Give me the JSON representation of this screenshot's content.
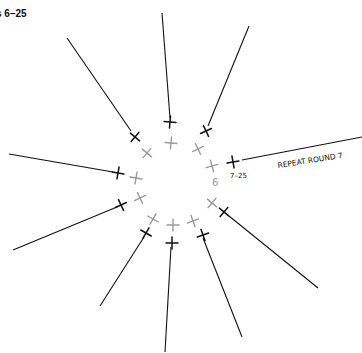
{
  "title": "s 6–25",
  "colors": {
    "ink": "#111111",
    "gray": "#9a9a9a",
    "bg": "#ffffff"
  },
  "annotations": {
    "repeat": "REPEAT ROUND 7",
    "round_label": "7–25",
    "round_number": "6"
  },
  "diagram": {
    "type": "crochet-round-chart",
    "spokes": [
      {
        "from": [
          67,
          38
        ],
        "to": [
          131,
          131
        ]
      },
      {
        "from": [
          162,
          13
        ],
        "to": [
          170,
          118
        ]
      },
      {
        "from": [
          249,
          26
        ],
        "to": [
          208,
          126
        ]
      },
      {
        "from": [
          242,
          160
        ],
        "to": [
          362,
          137
        ]
      },
      {
        "from": [
          229,
          216
        ],
        "to": [
          318,
          288
        ]
      },
      {
        "from": [
          203,
          238
        ],
        "to": [
          242,
          337
        ]
      },
      {
        "from": [
          171,
          247
        ],
        "to": [
          165,
          352
        ]
      },
      {
        "from": [
          144,
          237
        ],
        "to": [
          100,
          306
        ]
      },
      {
        "from": [
          117,
          207
        ],
        "to": [
          13,
          250
        ]
      },
      {
        "from": [
          113,
          172
        ],
        "to": [
          9,
          154
        ]
      }
    ],
    "black_stitches": [
      {
        "x": 135,
        "y": 137,
        "rot": 40
      },
      {
        "x": 170,
        "y": 122,
        "rot": 5
      },
      {
        "x": 206,
        "y": 131,
        "rot": -25
      },
      {
        "x": 233,
        "y": 162,
        "rot": -10
      },
      {
        "x": 224,
        "y": 212,
        "rot": 40
      },
      {
        "x": 203,
        "y": 235,
        "rot": -20
      },
      {
        "x": 172,
        "y": 243,
        "rot": 0
      },
      {
        "x": 146,
        "y": 233,
        "rot": 30
      },
      {
        "x": 121,
        "y": 205,
        "rot": -25
      },
      {
        "x": 118,
        "y": 173,
        "rot": 10
      }
    ],
    "gray_stitches": [
      {
        "x": 147,
        "y": 153,
        "rot": 40
      },
      {
        "x": 171,
        "y": 143,
        "rot": 5
      },
      {
        "x": 198,
        "y": 149,
        "rot": -25
      },
      {
        "x": 212,
        "y": 166,
        "rot": -15
      },
      {
        "x": 212,
        "y": 203,
        "rot": 40
      },
      {
        "x": 193,
        "y": 221,
        "rot": -20
      },
      {
        "x": 173,
        "y": 225,
        "rot": 0
      },
      {
        "x": 153,
        "y": 219,
        "rot": 30
      },
      {
        "x": 140,
        "y": 198,
        "rot": -25
      },
      {
        "x": 136,
        "y": 178,
        "rot": 10
      }
    ]
  }
}
